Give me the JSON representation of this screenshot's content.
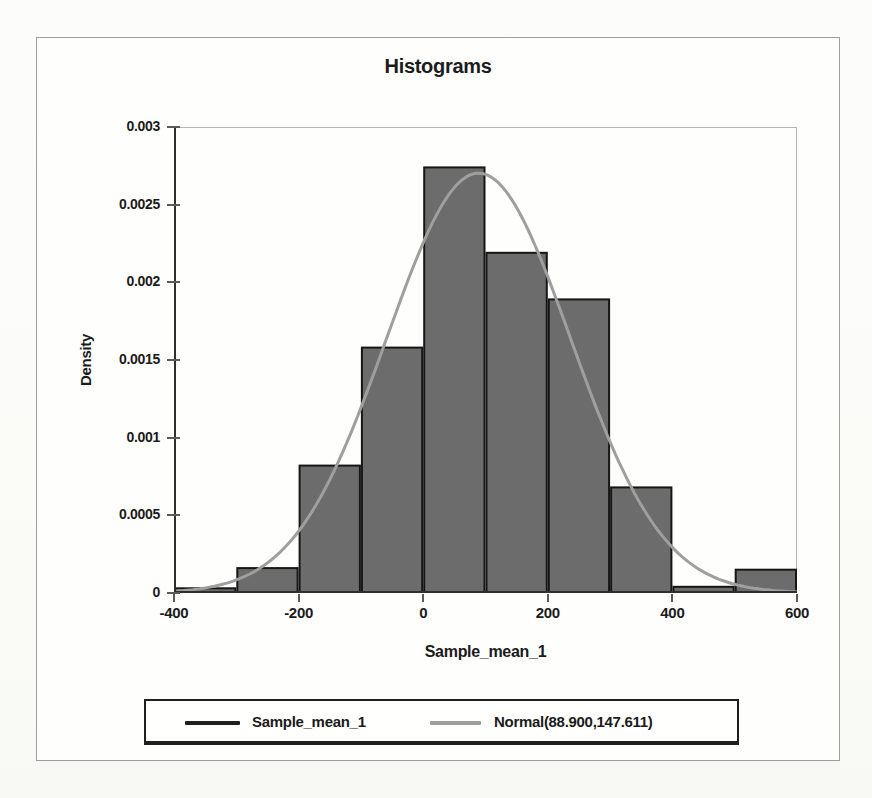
{
  "title": "Histograms",
  "chart_data": {
    "type": "bar",
    "subtype": "histogram-with-normal-overlay",
    "title": "Histograms",
    "xlabel": "Sample_mean_1",
    "ylabel": "Density",
    "xlim": [
      -400,
      600
    ],
    "ylim": [
      0,
      0.003
    ],
    "grid": false,
    "x_ticks": [
      -400,
      -200,
      0,
      200,
      400,
      600
    ],
    "x_tick_labels": [
      "-400",
      "-200",
      "0",
      "200",
      "400",
      "600"
    ],
    "y_ticks": [
      0,
      0.0005,
      0.001,
      0.0015,
      0.002,
      0.0025,
      0.003
    ],
    "y_tick_labels": [
      "0",
      "0.0005",
      "0.001",
      "0.0015",
      "0.002",
      "0.0025",
      "0.003"
    ],
    "bin_width": 100,
    "series_label": "Sample_mean_1",
    "bins": [
      {
        "x0": -400,
        "x1": -300,
        "density": 3e-05
      },
      {
        "x0": -300,
        "x1": -200,
        "density": 0.00016
      },
      {
        "x0": -200,
        "x1": -100,
        "density": 0.00082
      },
      {
        "x0": -100,
        "x1": 0,
        "density": 0.00158
      },
      {
        "x0": 0,
        "x1": 100,
        "density": 0.00274
      },
      {
        "x0": 100,
        "x1": 200,
        "density": 0.00219
      },
      {
        "x0": 200,
        "x1": 300,
        "density": 0.00189
      },
      {
        "x0": 300,
        "x1": 400,
        "density": 0.00068
      },
      {
        "x0": 400,
        "x1": 500,
        "density": 4e-05
      },
      {
        "x0": 500,
        "x1": 600,
        "density": 0.00015
      }
    ],
    "normal_overlay": {
      "mean": 88.9,
      "sd": 147.611,
      "label": "Normal(88.900,147.611)"
    },
    "legend_position": "bottom",
    "colors": {
      "bar_fill": "#6c6c6c",
      "bar_border": "#161616",
      "curve": "#9f9f9f",
      "axis": "#2f2f2f",
      "grid": "#b4b4b4",
      "tick": "#5a5a5a",
      "text": "#1b1b1b",
      "frame": "#9e9e9e"
    }
  },
  "legend": {
    "items": [
      {
        "label": "Sample_mean_1",
        "color": "#1f1f1f"
      },
      {
        "label": "Normal(88.900,147.611)",
        "color": "#9f9f9f"
      }
    ]
  }
}
